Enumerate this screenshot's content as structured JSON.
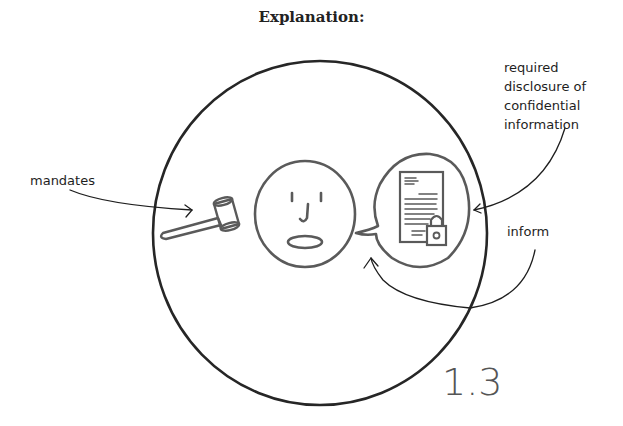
{
  "title": "Explanation:",
  "diagram": {
    "panel_number": "1.3",
    "labels": {
      "mandates": "mandates",
      "disclosure": [
        "required",
        "disclosure of",
        "confidential",
        "information"
      ],
      "inform": "inform"
    },
    "elements": [
      {
        "id": "outer-circle",
        "type": "circle"
      },
      {
        "id": "gavel",
        "type": "icon",
        "meaning": "law / mandate"
      },
      {
        "id": "face",
        "type": "icon",
        "meaning": "person"
      },
      {
        "id": "speech-bubble",
        "type": "icon",
        "meaning": "communication"
      },
      {
        "id": "locked-document",
        "type": "icon",
        "meaning": "confidential information"
      }
    ],
    "arrows": [
      {
        "from": "mandates",
        "to": "gavel"
      },
      {
        "from": "disclosure",
        "to": "speech-bubble"
      },
      {
        "from": "inform",
        "to": "speech-bubble-tail"
      }
    ],
    "colors": {
      "ink": "#1e1e1e",
      "sketch": "#5a5a5a"
    }
  }
}
